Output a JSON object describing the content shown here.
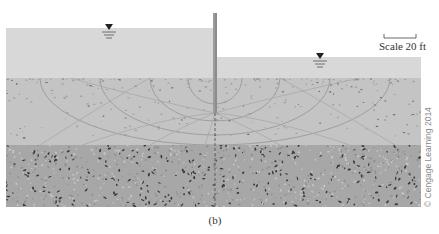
{
  "figure": {
    "caption": "(b)",
    "scale_label": "Scale 20 ft",
    "copyright": "© Cengage Learning 2014"
  },
  "layers": [
    {
      "name": "upstream-water",
      "color": "#d8d8d8"
    },
    {
      "name": "downstream-water",
      "color": "#d8d8d8"
    },
    {
      "name": "permeable-soil",
      "color": "#c4c4c4"
    },
    {
      "name": "impermeable-layer",
      "color": "#a7a7a7"
    }
  ],
  "symbols": {
    "water_table": "water-table-marker"
  },
  "colors": {
    "sheet_pile": "#8c8c8c",
    "flow_lines": "#9a9a9a",
    "equipotential_lines": "#a8a8a8",
    "speckle_dark": "#3a3a3a",
    "speckle_light": "#9d9d9d"
  }
}
